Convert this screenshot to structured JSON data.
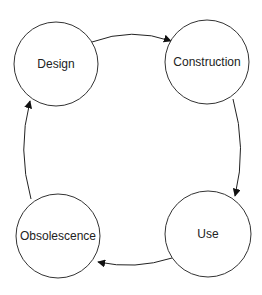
{
  "diagram": {
    "type": "cycle",
    "nodes": [
      {
        "id": "design",
        "label": "Design",
        "cx": 56,
        "cy": 64,
        "r": 42
      },
      {
        "id": "construction",
        "label": "Construction",
        "cx": 207,
        "cy": 62,
        "r": 42
      },
      {
        "id": "use",
        "label": "Use",
        "cx": 208,
        "cy": 234,
        "r": 43
      },
      {
        "id": "obsolescence",
        "label": "Obsolescence",
        "cx": 58,
        "cy": 236,
        "r": 42
      }
    ],
    "edges": [
      {
        "from": "design",
        "to": "construction"
      },
      {
        "from": "construction",
        "to": "use"
      },
      {
        "from": "use",
        "to": "obsolescence"
      },
      {
        "from": "obsolescence",
        "to": "design"
      }
    ],
    "colors": {
      "stroke": "#333333",
      "text": "#222222",
      "background": "#ffffff"
    }
  }
}
